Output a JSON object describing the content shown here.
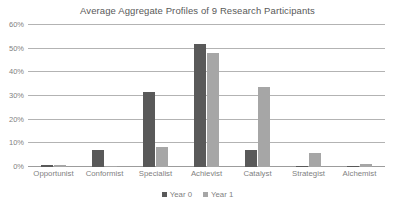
{
  "chart_data": {
    "type": "bar",
    "title": "Average Aggregate Profiles of 9 Research Participants",
    "xlabel": "",
    "ylabel": "",
    "ylim": [
      0,
      60
    ],
    "ytick_labels": [
      "0%",
      "10%",
      "20%",
      "30%",
      "40%",
      "50%",
      "60%"
    ],
    "ytick_values": [
      0,
      10,
      20,
      30,
      40,
      50,
      60
    ],
    "grid": true,
    "legend_position": "bottom",
    "categories": [
      "Opportunist",
      "Conformist",
      "Specialist",
      "Achievist",
      "Catalyst",
      "Strategist",
      "Alchemist"
    ],
    "series": [
      {
        "name": "Year 0",
        "color": "#595959",
        "values": [
          1,
          7,
          31.5,
          52,
          7,
          0.3,
          0.4
        ]
      },
      {
        "name": "Year 1",
        "color": "#a6a6a6",
        "values": [
          0.8,
          0.5,
          8.5,
          48,
          34,
          6,
          1.2
        ]
      }
    ]
  },
  "colors": {
    "series_0": "#595959",
    "series_1": "#a6a6a6",
    "gridline": "#b3b3b3",
    "text": "#7f7f7f",
    "title_text": "#595959",
    "background": "#ffffff"
  }
}
